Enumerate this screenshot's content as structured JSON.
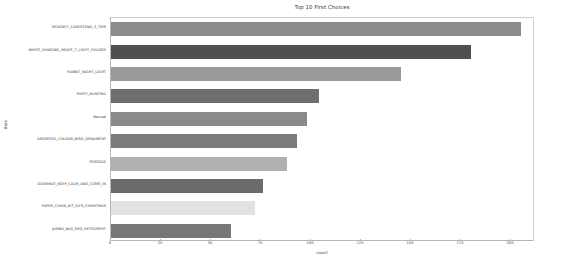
{
  "chart_data": {
    "type": "bar",
    "orientation": "horizontal",
    "title": "Top 10 First Choices",
    "xlabel": "count",
    "ylabel": "item",
    "xlim": [
      0,
      212
    ],
    "xticks": [
      0,
      25,
      50,
      75,
      100,
      125,
      150,
      175,
      200
    ],
    "grid": false,
    "legend": null,
    "categories": [
      "REGENCY_CAKESTAND_3_TIER",
      "WHITE_HANGING_HEART_T_LIGHT_HOLDER",
      "RABBIT_NIGHT_LIGHT",
      "PARTY_BUNTING",
      "Manual",
      "ASSORTED_COLOUR_BIRD_ORNAMENT",
      "POSTAGE",
      "DOORMAT_KEEP_CALM_AND_COME_IN",
      "PAPER_CHAIN_KIT_50'S_CHRISTMAS",
      "JUMBO_BAG_RED_RETROSPOT"
    ],
    "values": [
      205,
      180,
      145,
      104,
      98,
      93,
      88,
      76,
      72,
      60
    ],
    "bar_colors": [
      "#8c8c8c",
      "#4f4f4f",
      "#9a9a9a",
      "#6e6e6e",
      "#8a8a8a",
      "#7b7b7b",
      "#b0b0b0",
      "#6b6b6b",
      "#e2e2e2",
      "#777777"
    ]
  },
  "figure": {
    "background": "#ffffff",
    "axis_color": "#b7b7b7",
    "text_color": "#3d3d3d"
  }
}
